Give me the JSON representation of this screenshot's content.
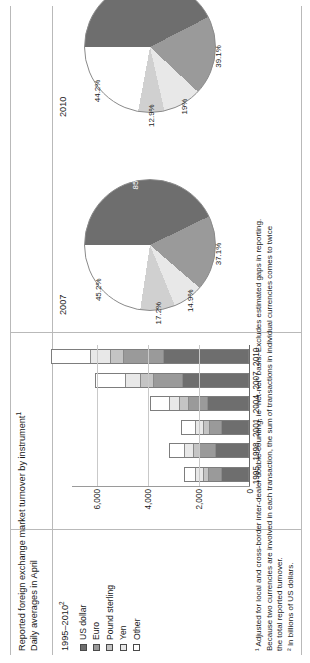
{
  "header": {
    "title": "Reported foreign exchange market turnover by instrument",
    "title_sup": "1",
    "subtitle": "Daily averages in April",
    "period": "1995–2010",
    "period_sup": "2"
  },
  "panels": {
    "bar_label": "1995–2010",
    "pie_2007_label": "2007",
    "pie_2010_label": "2010"
  },
  "legend": {
    "items": [
      {
        "label": "US dollar",
        "color": "#6e6e6e",
        "swatch_border": "#4a4a4a"
      },
      {
        "label": "Euro",
        "color": "#9a9a9a",
        "swatch_border": "#4a4a4a"
      },
      {
        "label": "Pound sterling",
        "color": "#c4c4c4",
        "swatch_border": "#4a4a4a"
      },
      {
        "label": "Yen",
        "color": "#e8e8e8",
        "swatch_border": "#4a4a4a"
      },
      {
        "label": "Other",
        "color": "#ffffff",
        "swatch_border": "#4a4a4a"
      }
    ]
  },
  "footnotes": {
    "line1": "¹ Adjusted for local and cross-border inter-dealer double-counting, ie “net-net” basis. Excludes estimated gaps in reporting.",
    "line2": "Because two currencies are involved in each transaction, the sum of transactions in individual currencies comes to twice",
    "line3": "the total reported turnover.",
    "line4": "² In billions of US dollars."
  },
  "chart_data": [
    {
      "type": "bar",
      "title": "Reported foreign exchange market turnover by instrument",
      "subtitle": "1995–2010",
      "xlabel": "",
      "ylabel": "Billions of US dollars",
      "categories": [
        "1995",
        "1998",
        "2001",
        "2004",
        "2007",
        "2010"
      ],
      "ylim": [
        0,
        7000
      ],
      "yticks": [
        "0",
        "2,000",
        "4,000",
        "6,000"
      ],
      "ytick_values": [
        0,
        2000,
        4000,
        6000
      ],
      "grid": true,
      "legend_position": "left",
      "stacked": true,
      "series": [
        {
          "name": "US dollar",
          "values": [
            1120,
            1360,
            1120,
            1700,
            2680,
            3440
          ]
        },
        {
          "name": "Euro",
          "values": [
            520,
            640,
            500,
            740,
            1160,
            1580
          ]
        },
        {
          "name": "Pound sterling",
          "values": [
            190,
            230,
            200,
            320,
            480,
            500
          ]
        },
        {
          "name": "Yen",
          "values": [
            290,
            320,
            300,
            400,
            590,
            760
          ]
        },
        {
          "name": "Other",
          "values": [
            470,
            620,
            580,
            740,
            1180,
            1570
          ]
        }
      ],
      "totals": [
        2590,
        3170,
        2700,
        3900,
        6090,
        7850
      ]
    },
    {
      "type": "pie",
      "title": "2007",
      "labels": [
        "US dollar",
        "Euro",
        "Yen",
        "Pound sterling",
        "Other"
      ],
      "data_labels": [
        "85.6%",
        "37.1%",
        "14.9%",
        "17.2%",
        "45.2%"
      ],
      "values": [
        85.6,
        37.1,
        14.9,
        17.2,
        45.2
      ],
      "note": "Shares sum to 200% because two currencies are involved in each transaction."
    },
    {
      "type": "pie",
      "title": "2010",
      "labels": [
        "US dollar",
        "Euro",
        "Yen",
        "Pound sterling",
        "Other"
      ],
      "data_labels": [
        "84.9%",
        "39.1%",
        "19%",
        "12.9%",
        "44.2%"
      ],
      "values": [
        84.9,
        39.1,
        19.0,
        12.9,
        44.2
      ],
      "note": "Shares sum to 200% because two currencies are involved in each transaction."
    }
  ]
}
